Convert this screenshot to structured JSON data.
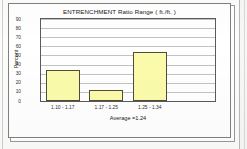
{
  "chart_data": {
    "type": "bar",
    "title": "ENTRENCHMENT  Ratio Range ( ft./ft. )",
    "xlabel": "Average =1.24",
    "ylabel": "Percent",
    "categories": [
      "1.10 - 1.17",
      "1.17 - 1.25",
      "1.25 - 1.34"
    ],
    "values": [
      34,
      12,
      54
    ],
    "ylim": [
      0,
      90
    ],
    "ytick_step": 10,
    "yticks": [
      90,
      80,
      70,
      60,
      50,
      40,
      30,
      20,
      10,
      0
    ],
    "grid": true,
    "legend": "none",
    "bar_fill_color": "#FBFBAB",
    "bar_border_color": "#4D4D3A",
    "plot_background": "#FFFFFF",
    "gridline_color": "#C2C2C2",
    "axis_color": "#5A5A5A",
    "empty_trailing_slot": true,
    "slot_count": 4
  },
  "page": {
    "frame_name": "chart-frame",
    "adjacent_page_visible": true
  }
}
